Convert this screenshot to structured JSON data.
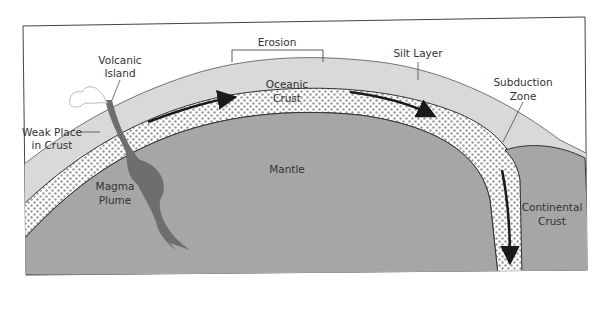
{
  "diagram": {
    "labels": {
      "erosion": "Erosion",
      "volcanic_island_1": "Volcanic",
      "volcanic_island_2": "Island",
      "silt_layer": "Silt Layer",
      "oceanic_crust_1": "Oceanic",
      "oceanic_crust_2": "Crust",
      "subduction_zone_1": "Subduction",
      "subduction_zone_2": "Zone",
      "weak_place_1": "Weak Place",
      "weak_place_2": "in Crust",
      "mantle": "Mantle",
      "magma_plume_1": "Magma",
      "magma_plume_2": "Plume",
      "continental_crust_1": "Continental",
      "continental_crust_2": "Crust"
    },
    "colors": {
      "background": "#ffffff",
      "frame": "#444444",
      "ocean": "#d9d9d9",
      "mantle": "#a6a6a6",
      "crust_fill": "#ffffff",
      "crust_dots": "#9a9a9a",
      "magma": "#6e6e6e",
      "continental": "#a6a6a6",
      "arrow": "#1a1a1a",
      "text": "#333333"
    }
  }
}
